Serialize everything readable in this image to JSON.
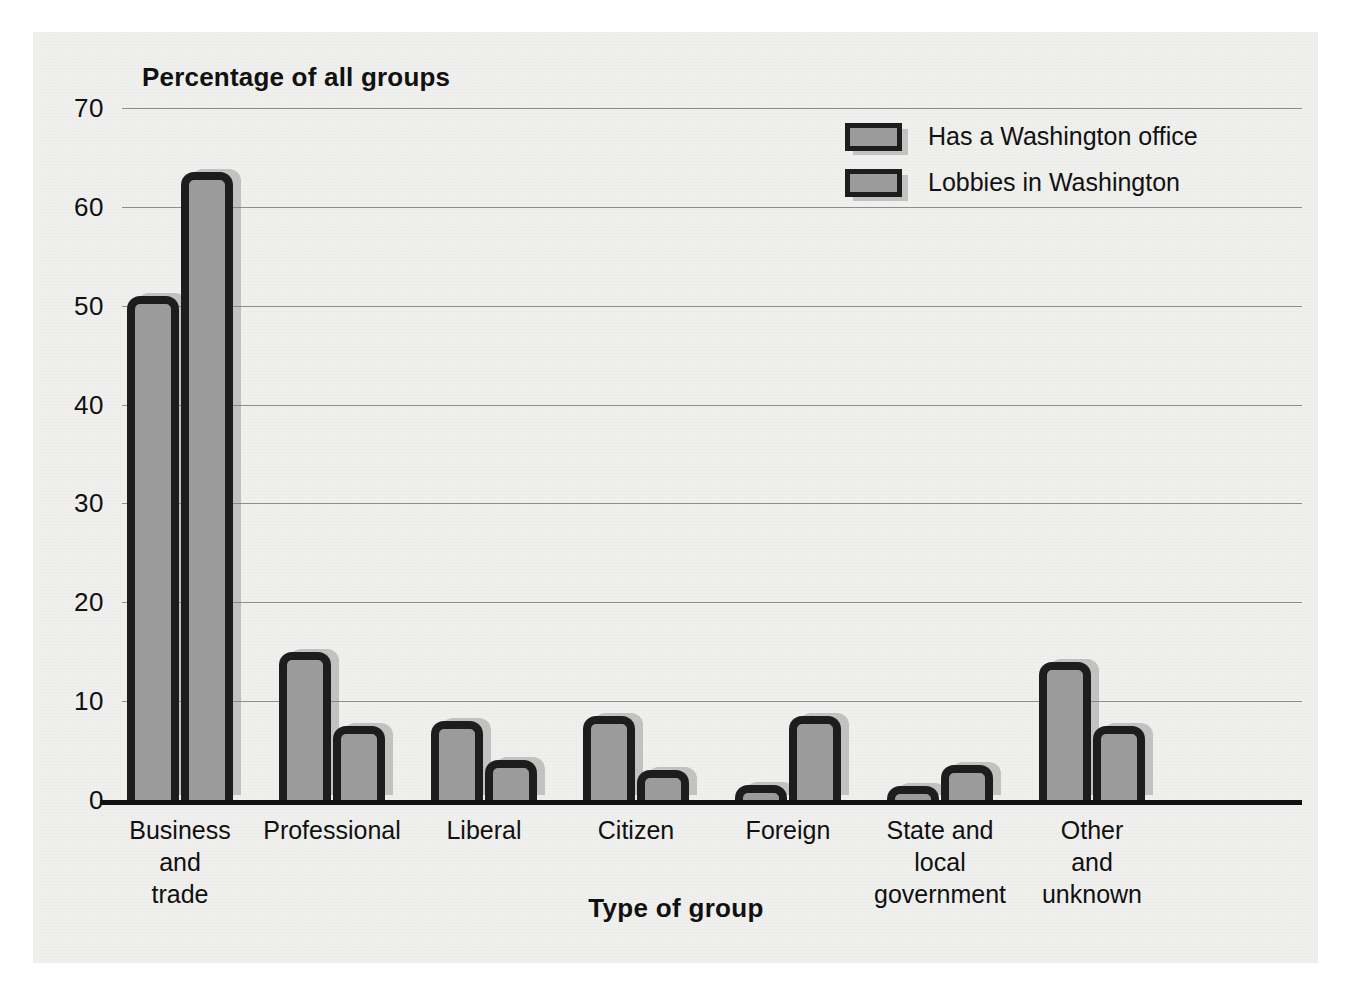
{
  "chart_data": {
    "type": "bar",
    "title": "",
    "ylabel": "Percentage of all groups",
    "xlabel": "Type of group",
    "ylim": [
      0,
      70
    ],
    "yticks": [
      0,
      10,
      20,
      30,
      40,
      50,
      60,
      70
    ],
    "ytick_labels": [
      "0",
      "10",
      "20",
      "30",
      "40",
      "50",
      "60",
      "70"
    ],
    "grid": "horizontal",
    "legend_position": "top-right",
    "categories": [
      "Business\nand\ntrade",
      "Professional",
      "Liberal",
      "Citizen",
      "Foreign",
      "State and\nlocal\ngovernment",
      "Other\nand\nunknown"
    ],
    "series": [
      {
        "name": "Has a Washington office",
        "values": [
          51,
          15,
          8,
          8.5,
          1.5,
          1,
          14
        ]
      },
      {
        "name": "Lobbies in Washington",
        "values": [
          63.5,
          7.5,
          4,
          3,
          8.5,
          3.5,
          7.5
        ]
      }
    ]
  },
  "legend": {
    "items": [
      {
        "label": "Has a Washington office"
      },
      {
        "label": "Lobbies in Washington"
      }
    ]
  },
  "colors": {
    "bar_fill": "#9b9b9b",
    "bar_border": "#1d1d1d",
    "panel_background": "#f0f0ee",
    "gridline": "#8e8e8e",
    "axis": "#111111",
    "text": "#111111",
    "shadow": "#787878"
  }
}
